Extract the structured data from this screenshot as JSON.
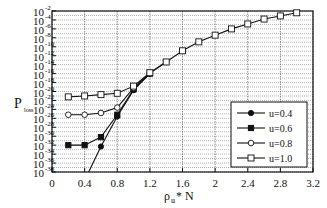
{
  "chart_data": {
    "type": "line",
    "title": "",
    "xlabel": "ρ_u * N",
    "ylabel": "P_loss",
    "xlim": [
      0,
      3.2
    ],
    "ylim_log10": [
      -38,
      -2
    ],
    "y_scale": "log",
    "grid": true,
    "legend_position": "lower right",
    "x_ticks": [
      "0",
      "0.4",
      "0.8",
      "1.2",
      "1.6",
      "2",
      "2.4",
      "2.8",
      "3.2"
    ],
    "x_tick_values": [
      0,
      0.4,
      0.8,
      1.2,
      1.6,
      2.0,
      2.4,
      2.8,
      3.2
    ],
    "y_ticks_exponents": [
      -2,
      -4,
      -6,
      -8,
      -10,
      -12,
      -14,
      -16,
      -18,
      -20,
      -22,
      -24,
      -26,
      -28,
      -30,
      -32,
      -34,
      -36,
      -38
    ],
    "series": [
      {
        "name": "u=0.4",
        "marker": "filled-circle",
        "x": [
          0.45,
          0.6,
          0.8,
          1.0,
          1.2
        ],
        "log10_y": [
          -38,
          -32.3,
          -25.6,
          -19.7,
          -16.0
        ]
      },
      {
        "name": "u=0.6",
        "marker": "filled-square",
        "x": [
          0.2,
          0.4,
          0.6,
          0.8,
          1.0,
          1.2
        ],
        "log10_y": [
          -32.0,
          -32.0,
          -30.2,
          -25.2,
          -19.5,
          -16.0
        ]
      },
      {
        "name": "u=0.8",
        "marker": "open-circle",
        "x": [
          0.2,
          0.4,
          0.6,
          0.8,
          1.0,
          1.2,
          1.4
        ],
        "log10_y": [
          -25.2,
          -25.2,
          -24.8,
          -23.6,
          -19.2,
          -15.9,
          -13.4
        ]
      },
      {
        "name": "u=1.0",
        "marker": "open-square",
        "x": [
          0.2,
          0.4,
          0.6,
          0.8,
          1.0,
          1.2,
          1.4,
          1.6,
          1.8,
          2.0,
          2.2,
          2.4,
          2.6,
          2.8,
          3.0
        ],
        "log10_y": [
          -21.2,
          -21.0,
          -20.7,
          -20.4,
          -18.8,
          -15.8,
          -13.4,
          -10.9,
          -8.9,
          -7.4,
          -6.0,
          -4.9,
          -3.8,
          -3.1,
          -2.4
        ]
      }
    ]
  },
  "axes": {
    "y_title_main": "P",
    "y_title_sub": "loss",
    "x_title_main": "ρ",
    "x_title_sub": "u",
    "x_title_rest": " * N",
    "y_tick_base": "10"
  },
  "legend": {
    "items": [
      "u=0.4",
      "u=0.6",
      "u=0.8",
      "u=1.0"
    ]
  }
}
